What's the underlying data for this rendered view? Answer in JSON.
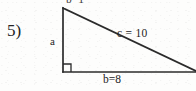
{
  "problem": {
    "number_label": "5)",
    "type": "right-triangle-diagram"
  },
  "labels": {
    "leg_a": "a",
    "leg_b": "b=8",
    "hypotenuse_c": "c = 10",
    "top_cutoff_text": "b=1"
  },
  "colors": {
    "background": "#fdfdfc",
    "ink": "#242424",
    "stroke": "#2b2b2b"
  },
  "figure": {
    "shape": "right triangle",
    "right_angle_vertex": "bottom-left",
    "vertices": {
      "top": [
        63,
        8
      ],
      "bottom_left": [
        63,
        72
      ],
      "bottom_right": [
        196,
        72
      ]
    },
    "right_angle_marker_size": 8,
    "stroke_width": 1.6,
    "sides": {
      "vertical_leg": "a",
      "horizontal_leg": "b=8",
      "hypotenuse": "c = 10"
    }
  }
}
